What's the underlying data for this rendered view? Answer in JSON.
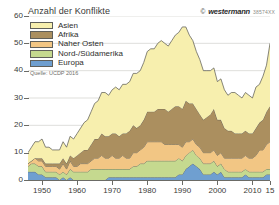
{
  "header": {
    "title": "Anzahl der Konflikte",
    "brand_copyright": "©",
    "brand_name": "westermann",
    "brand_code": "38574XX"
  },
  "source_note": "Quelle: UCDP 2016",
  "legend": {
    "items": [
      {
        "label": "Asien",
        "color": "#f7efae"
      },
      {
        "label": "Afrika",
        "color": "#ab8f5f"
      },
      {
        "label": "Naher Osten",
        "color": "#f2c684"
      },
      {
        "label": "Nord-/Südamerika",
        "color": "#c5d98f"
      },
      {
        "label": "Europa",
        "color": "#6f9fd0"
      }
    ]
  },
  "axes": {
    "y_label": "Anzahl der Konflikte",
    "y_ticks": [
      "0",
      "10",
      "20",
      "30",
      "40",
      "50",
      "60"
    ],
    "x_ticks": [
      "1950",
      "1960",
      "1970",
      "1980",
      "1990",
      "2000",
      "2010",
      "15"
    ]
  },
  "chart_data": {
    "type": "area",
    "stacked": true,
    "title": "Anzahl der Konflikte",
    "xlabel": "",
    "ylabel": "Anzahl der Konflikte",
    "ylim": [
      0,
      60
    ],
    "xlim": [
      1946,
      2015
    ],
    "grid": true,
    "legend_position": "top-left",
    "source": "Quelle: UCDP 2016",
    "x": [
      1946,
      1947,
      1948,
      1949,
      1950,
      1951,
      1952,
      1953,
      1954,
      1955,
      1956,
      1957,
      1958,
      1959,
      1960,
      1961,
      1962,
      1963,
      1964,
      1965,
      1966,
      1967,
      1968,
      1969,
      1970,
      1971,
      1972,
      1973,
      1974,
      1975,
      1976,
      1977,
      1978,
      1979,
      1980,
      1981,
      1982,
      1983,
      1984,
      1985,
      1986,
      1987,
      1988,
      1989,
      1990,
      1991,
      1992,
      1993,
      1994,
      1995,
      1996,
      1997,
      1998,
      1999,
      2000,
      2001,
      2002,
      2003,
      2004,
      2005,
      2006,
      2007,
      2008,
      2009,
      2010,
      2011,
      2012,
      2013,
      2014,
      2015
    ],
    "series": [
      {
        "name": "Europa",
        "color": "#6f9fd0",
        "values": [
          3,
          3,
          3,
          2,
          2,
          1,
          1,
          1,
          1,
          0,
          1,
          0,
          1,
          0,
          0,
          0,
          0,
          0,
          0,
          0,
          0,
          0,
          0,
          1,
          1,
          1,
          1,
          1,
          1,
          1,
          1,
          1,
          1,
          1,
          1,
          1,
          1,
          1,
          1,
          1,
          1,
          1,
          1,
          2,
          2,
          4,
          5,
          6,
          5,
          4,
          2,
          2,
          2,
          3,
          2,
          3,
          1,
          1,
          1,
          1,
          1,
          1,
          2,
          1,
          1,
          1,
          1,
          1,
          2,
          2
        ]
      },
      {
        "name": "Nord-/Südamerika",
        "color": "#c5d98f",
        "values": [
          2,
          3,
          3,
          3,
          3,
          2,
          2,
          2,
          2,
          2,
          2,
          2,
          3,
          3,
          3,
          3,
          3,
          3,
          4,
          4,
          4,
          4,
          4,
          3,
          3,
          3,
          3,
          3,
          3,
          3,
          4,
          4,
          5,
          5,
          6,
          6,
          6,
          6,
          6,
          6,
          6,
          6,
          6,
          6,
          5,
          5,
          5,
          5,
          4,
          4,
          4,
          4,
          4,
          4,
          3,
          3,
          3,
          2,
          2,
          2,
          2,
          2,
          2,
          2,
          2,
          2,
          2,
          2,
          2,
          2
        ]
      },
      {
        "name": "Naher Osten",
        "color": "#f2c684",
        "values": [
          1,
          1,
          2,
          2,
          2,
          2,
          2,
          2,
          2,
          2,
          3,
          2,
          3,
          2,
          2,
          3,
          3,
          3,
          3,
          4,
          4,
          5,
          4,
          4,
          5,
          4,
          4,
          5,
          4,
          4,
          5,
          5,
          5,
          6,
          7,
          7,
          7,
          7,
          7,
          6,
          6,
          6,
          6,
          5,
          5,
          5,
          4,
          4,
          4,
          4,
          4,
          4,
          4,
          4,
          4,
          4,
          4,
          5,
          5,
          5,
          5,
          5,
          5,
          5,
          5,
          6,
          8,
          8,
          9,
          10
        ]
      },
      {
        "name": "Afrika",
        "color": "#ab8f5f",
        "values": [
          0,
          0,
          0,
          1,
          1,
          1,
          1,
          1,
          1,
          2,
          2,
          2,
          2,
          3,
          4,
          4,
          5,
          5,
          6,
          7,
          7,
          8,
          8,
          8,
          8,
          9,
          8,
          8,
          9,
          10,
          10,
          9,
          9,
          10,
          11,
          11,
          11,
          12,
          12,
          13,
          12,
          13,
          14,
          14,
          14,
          15,
          14,
          13,
          13,
          12,
          12,
          13,
          14,
          15,
          13,
          12,
          11,
          10,
          10,
          9,
          9,
          9,
          9,
          9,
          9,
          10,
          10,
          11,
          12,
          13
        ]
      },
      {
        "name": "Asien",
        "color": "#f7efae",
        "values": [
          4,
          5,
          6,
          6,
          7,
          6,
          6,
          5,
          5,
          5,
          6,
          6,
          7,
          7,
          8,
          9,
          10,
          11,
          12,
          13,
          14,
          15,
          16,
          15,
          16,
          17,
          17,
          18,
          18,
          18,
          19,
          20,
          20,
          21,
          22,
          23,
          23,
          24,
          25,
          24,
          24,
          25,
          26,
          27,
          30,
          27,
          25,
          23,
          21,
          20,
          18,
          17,
          16,
          15,
          14,
          15,
          14,
          13,
          14,
          15,
          14,
          13,
          14,
          14,
          13,
          15,
          14,
          16,
          17,
          23
        ]
      }
    ]
  }
}
